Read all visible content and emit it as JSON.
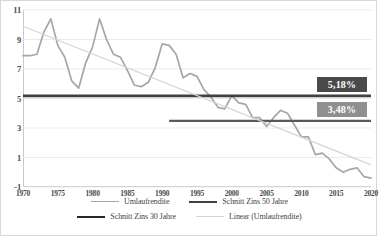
{
  "chart_data": {
    "type": "line",
    "title": "",
    "subtitle": "",
    "xlabel": "",
    "ylabel": "",
    "xlim": [
      1970,
      2020
    ],
    "ylim": [
      -1,
      11
    ],
    "grid": true,
    "legend_position": "bottom",
    "y_ticks": [
      "11",
      "9",
      "7",
      "5",
      "3",
      "1",
      "-1"
    ],
    "y_tick_values": [
      11,
      9,
      7,
      5,
      3,
      1,
      -1
    ],
    "x_ticks": [
      "1970",
      "1975",
      "1980",
      "1985",
      "1990",
      "1995",
      "2000",
      "2005",
      "2010",
      "2015",
      "2020"
    ],
    "x_tick_values": [
      1970,
      1975,
      1980,
      1985,
      1990,
      1995,
      2000,
      2005,
      2010,
      2015,
      2020
    ],
    "x": [
      1970,
      1971,
      1972,
      1973,
      1974,
      1975,
      1976,
      1977,
      1978,
      1979,
      1980,
      1981,
      1982,
      1983,
      1984,
      1985,
      1986,
      1987,
      1988,
      1989,
      1990,
      1991,
      1992,
      1993,
      1994,
      1995,
      1996,
      1997,
      1998,
      1999,
      2000,
      2001,
      2002,
      2003,
      2004,
      2005,
      2006,
      2007,
      2008,
      2009,
      2010,
      2011,
      2012,
      2013,
      2014,
      2015,
      2016,
      2017,
      2018,
      2019,
      2020
    ],
    "series": [
      {
        "name": "Umlaufrendite",
        "color": "#a6a6a6",
        "type": "line",
        "values": [
          7.9,
          7.9,
          8.0,
          9.5,
          10.4,
          8.6,
          7.8,
          6.2,
          5.7,
          7.4,
          8.5,
          10.4,
          9.0,
          8.0,
          7.8,
          6.9,
          5.9,
          5.8,
          6.1,
          7.1,
          8.7,
          8.6,
          8.0,
          6.4,
          6.7,
          6.5,
          5.6,
          5.1,
          4.4,
          4.3,
          5.2,
          4.7,
          4.6,
          3.7,
          3.7,
          3.1,
          3.7,
          4.2,
          4.0,
          3.2,
          2.4,
          2.4,
          1.2,
          1.3,
          0.9,
          0.3,
          0.0,
          0.2,
          0.3,
          -0.3,
          -0.4
        ]
      },
      {
        "name": "Schnitt Zins 50 Jahre",
        "color": "#404040",
        "type": "hline",
        "value": 5.18,
        "x_start": 1970,
        "x_end": 2020
      },
      {
        "name": "Schnitt Zins 30 Jahre",
        "color": "#595959",
        "type": "hline",
        "value": 3.48,
        "x_start": 1991,
        "x_end": 2020
      },
      {
        "name": "Linear (Umlaufrendite)",
        "color": "#d4d4d4",
        "type": "trendline",
        "x_start": 1970,
        "x_end": 2020,
        "y_start": 9.9,
        "y_end": 0.5
      }
    ],
    "annotations": [
      {
        "label": "5,18%",
        "value": 5.18,
        "box_color": "#4a4a4a",
        "text_color": "#ffffff"
      },
      {
        "label": "3,48%",
        "value": 3.48,
        "box_color": "#8f8f8f",
        "text_color": "#ffffff"
      }
    ],
    "legend": [
      {
        "label": "Umlaufrendite",
        "swatch": "sw-umlauf"
      },
      {
        "label": "Schnitt Zins 50 Jahre",
        "swatch": "sw-50"
      },
      {
        "label": "Schnitt Zins 30 Jahre",
        "swatch": "sw-30"
      },
      {
        "label": "Linear (Umlaufrendite)",
        "swatch": "sw-linear"
      }
    ]
  }
}
